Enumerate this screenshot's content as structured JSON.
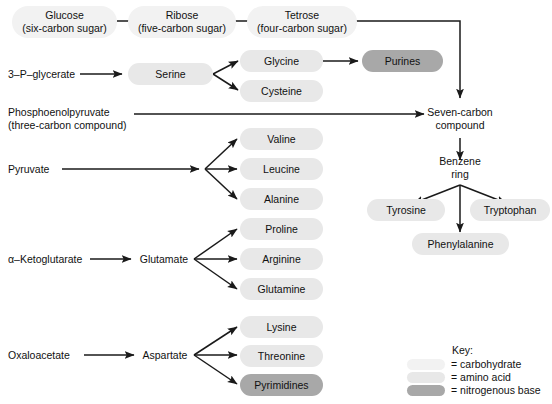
{
  "diagram": {
    "colors": {
      "carbohydrate": "#f2f2f2",
      "amino_acid": "#e8e8e8",
      "nitrogenous_base": "#a8a8a8",
      "arrow": "#1a1a1a",
      "text": "#111111",
      "background": "#ffffff"
    },
    "nodes": {
      "glucose": {
        "line1": "Glucose",
        "line2": "(six-carbon sugar)",
        "category": "carbohydrate"
      },
      "ribose": {
        "line1": "Ribose",
        "line2": "(five-carbon sugar)",
        "category": "carbohydrate"
      },
      "tetrose": {
        "line1": "Tetrose",
        "line2": "(four-carbon sugar)",
        "category": "carbohydrate"
      },
      "three_p_glycerate": {
        "label": "3–P–glycerate",
        "category": "plain"
      },
      "serine": {
        "label": "Serine",
        "category": "amino_acid"
      },
      "glycine": {
        "label": "Glycine",
        "category": "amino_acid"
      },
      "cysteine": {
        "label": "Cysteine",
        "category": "amino_acid"
      },
      "purines": {
        "label": "Purines",
        "category": "nitrogenous_base"
      },
      "phosphoenolpyruvate": {
        "line1": "Phosphoenolpyruvate",
        "line2": "(three-carbon compound)",
        "category": "plain"
      },
      "seven_carbon_compound": {
        "line1": "Seven-carbon",
        "line2": "compound",
        "category": "plain"
      },
      "benzene_ring": {
        "line1": "Benzene",
        "line2": "ring",
        "category": "plain"
      },
      "tyrosine": {
        "label": "Tyrosine",
        "category": "amino_acid"
      },
      "phenylalanine": {
        "label": "Phenylalanine",
        "category": "amino_acid"
      },
      "tryptophan": {
        "label": "Tryptophan",
        "category": "amino_acid"
      },
      "pyruvate": {
        "label": "Pyruvate",
        "category": "plain"
      },
      "valine": {
        "label": "Valine",
        "category": "amino_acid"
      },
      "leucine": {
        "label": "Leucine",
        "category": "amino_acid"
      },
      "alanine": {
        "label": "Alanine",
        "category": "amino_acid"
      },
      "alpha_ketoglutarate": {
        "label": "α–Ketoglutarate",
        "category": "plain"
      },
      "glutamate": {
        "label": "Glutamate",
        "category": "plain"
      },
      "proline": {
        "label": "Proline",
        "category": "amino_acid"
      },
      "arginine": {
        "label": "Arginine",
        "category": "amino_acid"
      },
      "glutamine": {
        "label": "Glutamine",
        "category": "amino_acid"
      },
      "oxaloacetate": {
        "label": "Oxaloacetate",
        "category": "plain"
      },
      "aspartate": {
        "label": "Aspartate",
        "category": "plain"
      },
      "lysine": {
        "label": "Lysine",
        "category": "amino_acid"
      },
      "threonine": {
        "label": "Threonine",
        "category": "amino_acid"
      },
      "pyrimidines": {
        "label": "Pyrimidines",
        "category": "nitrogenous_base"
      }
    },
    "key": {
      "title": "Key:",
      "entries": [
        {
          "swatch": "carbohydrate",
          "label": "= carbohydrate"
        },
        {
          "swatch": "amino_acid",
          "label": "= amino acid"
        },
        {
          "swatch": "nitrogenous_base",
          "label": "= nitrogenous base"
        }
      ]
    },
    "edges": [
      {
        "from": "glucose",
        "to": "ribose"
      },
      {
        "from": "ribose",
        "to": "tetrose"
      },
      {
        "from": "tetrose",
        "to": "seven_carbon_compound"
      },
      {
        "from": "three_p_glycerate",
        "to": "serine"
      },
      {
        "from": "serine",
        "to": "glycine"
      },
      {
        "from": "serine",
        "to": "cysteine"
      },
      {
        "from": "glycine",
        "to": "purines"
      },
      {
        "from": "phosphoenolpyruvate",
        "to": "seven_carbon_compound"
      },
      {
        "from": "seven_carbon_compound",
        "to": "benzene_ring"
      },
      {
        "from": "benzene_ring",
        "to": "tyrosine"
      },
      {
        "from": "benzene_ring",
        "to": "phenylalanine"
      },
      {
        "from": "benzene_ring",
        "to": "tryptophan"
      },
      {
        "from": "pyruvate",
        "to": "valine"
      },
      {
        "from": "pyruvate",
        "to": "leucine"
      },
      {
        "from": "pyruvate",
        "to": "alanine"
      },
      {
        "from": "alpha_ketoglutarate",
        "to": "glutamate"
      },
      {
        "from": "glutamate",
        "to": "proline"
      },
      {
        "from": "glutamate",
        "to": "arginine"
      },
      {
        "from": "glutamate",
        "to": "glutamine"
      },
      {
        "from": "oxaloacetate",
        "to": "aspartate"
      },
      {
        "from": "aspartate",
        "to": "lysine"
      },
      {
        "from": "aspartate",
        "to": "threonine"
      },
      {
        "from": "aspartate",
        "to": "pyrimidines"
      }
    ]
  }
}
